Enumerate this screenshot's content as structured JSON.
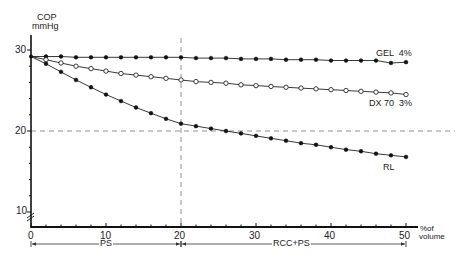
{
  "chart_data": {
    "type": "line",
    "title": "",
    "ylabel": "COP\nmmHg",
    "ylabel_line1": "COP",
    "ylabel_line2": "mmHg",
    "xlabel": "% of volume",
    "xlabel_line1": "% of",
    "xlabel_line2": "volume",
    "xlim": [
      0,
      50
    ],
    "ylim": [
      8,
      32
    ],
    "x_ticks": [
      0,
      10,
      20,
      30,
      40,
      50
    ],
    "y_ticks": [
      10,
      20,
      30
    ],
    "axis_break": true,
    "reference_lines": [
      {
        "orientation": "horizontal",
        "value": 20,
        "style": "dashed"
      },
      {
        "orientation": "vertical",
        "value": 20,
        "style": "dashed"
      }
    ],
    "phase_annotations": [
      {
        "label": "PS",
        "from": 0,
        "to": 20
      },
      {
        "label": "RCC+PS",
        "from": 20,
        "to": 50
      }
    ],
    "x": [
      0,
      2,
      4,
      6,
      8,
      10,
      12,
      14,
      16,
      18,
      20,
      22,
      24,
      26,
      28,
      30,
      32,
      34,
      36,
      38,
      40,
      42,
      44,
      46,
      48,
      50
    ],
    "series": [
      {
        "name": "GEL 4%",
        "marker": "filled-circle",
        "values": [
          29.2,
          29.2,
          29.2,
          29.1,
          29.1,
          29.1,
          29.1,
          29.1,
          29.1,
          29.1,
          29.1,
          29.0,
          29.0,
          29.0,
          28.9,
          28.9,
          28.9,
          28.8,
          28.8,
          28.8,
          28.7,
          28.7,
          28.7,
          28.7,
          28.4,
          28.5
        ]
      },
      {
        "name": "DX 70 3%",
        "marker": "open-circle",
        "values": [
          29.2,
          28.8,
          28.4,
          28.0,
          27.7,
          27.4,
          27.1,
          26.9,
          26.7,
          26.5,
          26.3,
          26.1,
          26.0,
          25.9,
          25.7,
          25.6,
          25.5,
          25.4,
          25.3,
          25.2,
          25.1,
          25.0,
          24.9,
          24.8,
          24.7,
          24.5
        ]
      },
      {
        "name": "RL",
        "marker": "filled-circle",
        "values": [
          29.2,
          28.3,
          27.3,
          26.3,
          25.4,
          24.5,
          23.7,
          22.9,
          22.2,
          21.5,
          20.9,
          20.6,
          20.3,
          20.0,
          19.7,
          19.4,
          19.1,
          18.8,
          18.5,
          18.3,
          18.0,
          17.7,
          17.5,
          17.2,
          17.0,
          16.8
        ]
      }
    ],
    "series_labels": [
      "GEL  4%",
      "DX 70  3%",
      "RL"
    ],
    "grid": false,
    "legend_position": "inline-right"
  },
  "labels": {
    "cop": "COP",
    "mmhg": "mmHg",
    "pct_of": "%of",
    "volume": "volume",
    "ps": "PS",
    "rcc_ps": "RCC+PS",
    "gel": "GEL  4%",
    "dx70": "DX 70  3%",
    "rl": "RL",
    "y30": "30",
    "y20": "20",
    "y10": "10",
    "x0": "0",
    "x10": "10",
    "x20": "20",
    "x30": "30",
    "x40": "40",
    "x50": "50"
  }
}
